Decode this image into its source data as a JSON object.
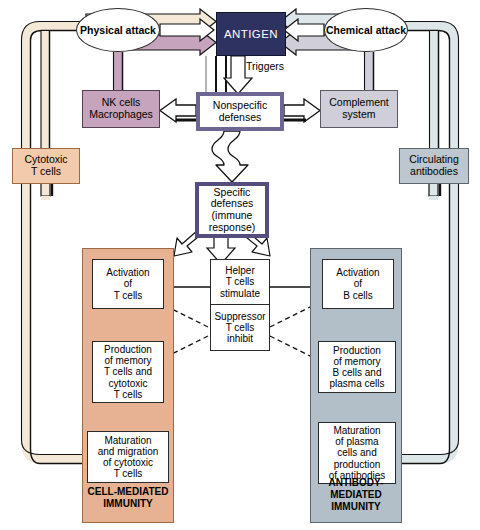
{
  "diagram": {
    "colors": {
      "antigen_fill": "#2e3260",
      "nk_fill": "#c7a4bd",
      "complement_fill": "#cfced9",
      "cytotoxic_fill": "#f2cbac",
      "circulating_fill": "#bcc7cf",
      "cell_panel_fill": "#e7b294",
      "antibody_panel_fill": "#b3bfc8",
      "specific_border": "#554d7e",
      "nonspecific_border": "#6d6692",
      "cream_pipe": "#f3e9d6",
      "blue_pipe": "#dde7e9",
      "mauve_pipe": "#c7a4bd"
    }
  },
  "nodes": {
    "physical_attack": "Physical\nattack",
    "physical_attack_l1": "Physical",
    "physical_attack_l2": "attack",
    "chemical_attack_l1": "Chemical",
    "chemical_attack_l2": "attack",
    "antigen": "ANTIGEN",
    "triggers": "Triggers",
    "nk_cells_l1": "NK cells",
    "nk_cells_l2": "Macrophages",
    "nonspecific_l1": "Nonspecific",
    "nonspecific_l2": "defenses",
    "complement_l1": "Complement",
    "complement_l2": "system",
    "cytotoxic_l1": "Cytotoxic",
    "cytotoxic_l2": "T cells",
    "circulating_l1": "Circulating",
    "circulating_l2": "antibodies",
    "specific_l1": "Specific",
    "specific_l2": "defenses",
    "specific_l3": "(immune",
    "specific_l4": "response)",
    "activation_t_l1": "Activation",
    "activation_t_l2": "of",
    "activation_t_l3": "T cells",
    "helper_l1": "Helper",
    "helper_l2": "T cells",
    "helper_l3": "stimulate",
    "suppressor_l1": "Suppressor",
    "suppressor_l2": "T cells",
    "suppressor_l3": "inhibit",
    "activation_b_l1": "Activation",
    "activation_b_l2": "of",
    "activation_b_l3": "B cells",
    "production_t_l1": "Production",
    "production_t_l2": "of memory",
    "production_t_l3": "T cells and",
    "production_t_l4": "cytotoxic",
    "production_t_l5": "T cells",
    "production_b_l1": "Production",
    "production_b_l2": "of memory",
    "production_b_l3": "B cells and",
    "production_b_l4": "plasma cells",
    "maturation_t_l1": "Maturation",
    "maturation_t_l2": "and migration",
    "maturation_t_l3": "of cytotoxic",
    "maturation_t_l4": "T cells",
    "maturation_b_l1": "Maturation",
    "maturation_b_l2": "of plasma",
    "maturation_b_l3": "cells and",
    "maturation_b_l4": "production",
    "maturation_b_l5": "of antibodies"
  },
  "panels": {
    "cell_mediated_l1": "CELL-MEDIATED",
    "cell_mediated_l2": "IMMUNITY",
    "antibody_mediated_l1": "ANTIBODY-",
    "antibody_mediated_l2": "MEDIATED",
    "antibody_mediated_l3": "IMMUNITY"
  }
}
